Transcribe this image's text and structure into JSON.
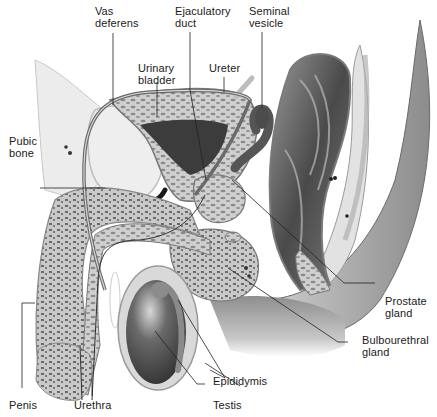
{
  "figure": {
    "palette": {
      "background": "#ffffff",
      "label_text": "#1a1a1a",
      "leader_line": "#222222",
      "tissue_light": "#e6e6e6",
      "tissue_mid": "#b4b4b4",
      "tissue_dark": "#5a5a5a",
      "cavity_dark": "#3a3a3a"
    }
  },
  "labels": {
    "vas_deferens": "Vas\ndeferens",
    "ejaculatory_duct": "Ejaculatory\nduct",
    "seminal_vesicle": "Seminal\nvesicle",
    "urinary_bladder": "Urinary\nbladder",
    "ureter": "Ureter",
    "pubic_bone": "Pubic\nbone",
    "prostate_gland": "Prostate\ngland",
    "bulbourethral_gland": "Bulbourethral\ngland",
    "epididymis": "Epididymis",
    "testis": "Testis",
    "penis": "Penis",
    "urethra": "Urethra"
  }
}
